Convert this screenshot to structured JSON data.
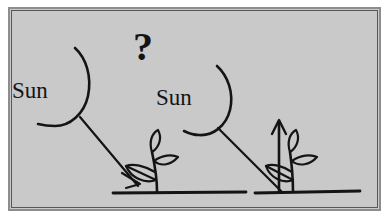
{
  "figure": {
    "caption": "",
    "colors": {
      "page_background": "#ffffff",
      "plate_background": "#c9c9c9",
      "frame_outer": "#8d8d8d",
      "frame_inner": "#55575a",
      "ink": "#141414"
    },
    "annotations": {
      "question_mark": "?",
      "sun_left_label": "Sun",
      "sun_right_label": "Sun"
    },
    "elements": {
      "sun_left": "sun-arc-icon",
      "sun_right": "sun-arc-icon",
      "ray_left": "sunlight-ray-arrow",
      "ray_right": "sunlight-ray-arrow",
      "plant_left": "seedling-icon",
      "plant_right": "seedling-icon",
      "growth_arrow": "upward-growth-arrow",
      "ground": "ground-line"
    }
  }
}
